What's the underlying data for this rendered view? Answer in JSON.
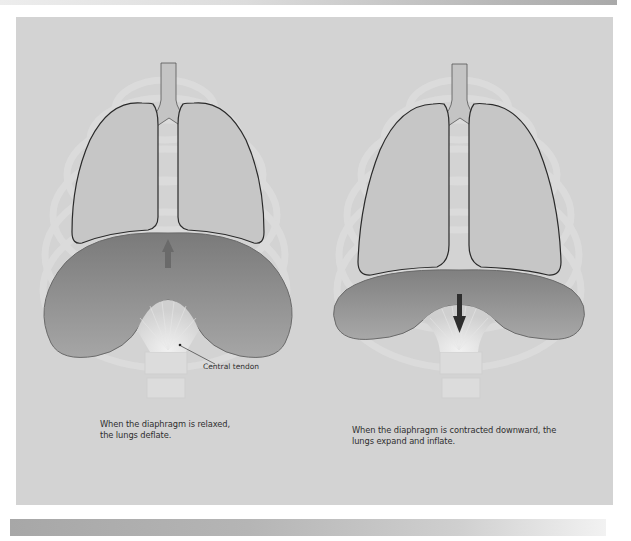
{
  "figure": {
    "panels": [
      {
        "id": "relaxed",
        "state": "Diaphragm relaxed",
        "arrow_direction": "up",
        "caption_lines": [
          "When the diaphragm is relaxed,",
          "the lungs deflate."
        ],
        "callout": "Central tendon"
      },
      {
        "id": "contracted",
        "state": "Diaphragm contracted",
        "arrow_direction": "down",
        "caption_lines": [
          "When the diaphragm is contracted downward, the",
          "lungs expand and inflate."
        ]
      }
    ],
    "colors": {
      "background": "#d3d3d3",
      "lung_fill": "#c6c6c6",
      "lung_outline": "#2a2a2a",
      "diaphragm_dark": "#7c7c7c",
      "diaphragm_light": "#a2a2a2",
      "rib_ghost": "#dedede",
      "arrow_up": "#6a6a6a",
      "arrow_down": "#2e2e2e"
    }
  }
}
